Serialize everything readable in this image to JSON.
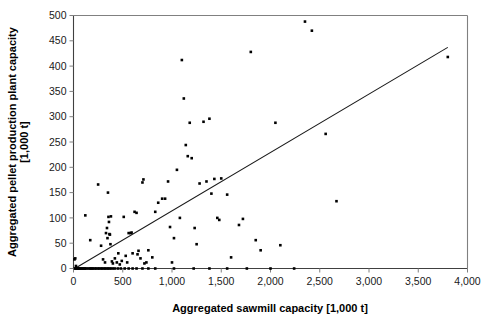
{
  "chart_data": {
    "type": "scatter",
    "title": "",
    "xlabel": "Aggregated sawmill capacity [1,000 t]",
    "ylabel": "Aggregated pellet production plant capacity [1,000 t]",
    "ylabel_line1": "Aggregated pellet production plant capacity",
    "ylabel_line2": "[1,000 t]",
    "xlim": [
      0,
      4000
    ],
    "ylim": [
      0,
      500
    ],
    "xticks": [
      0,
      500,
      1000,
      1500,
      2000,
      2500,
      3000,
      3500,
      4000
    ],
    "xtick_labels": [
      "0",
      "500",
      "1,000",
      "1,500",
      "2,000",
      "2,500",
      "3,000",
      "3,500",
      "4,000"
    ],
    "yticks": [
      0,
      50,
      100,
      150,
      200,
      250,
      300,
      350,
      400,
      450,
      500
    ],
    "ytick_labels": [
      "0",
      "50",
      "100",
      "150",
      "200",
      "250",
      "300",
      "350",
      "400",
      "450",
      "500"
    ],
    "grid": false,
    "legend": null,
    "marker": "square",
    "marker_color": "#000000",
    "trendline": {
      "type": "linear",
      "x": [
        30,
        3800
      ],
      "y": [
        2,
        437
      ],
      "color": "#1a1a1a"
    },
    "points": [
      [
        15,
        0
      ],
      [
        20,
        0
      ],
      [
        25,
        5
      ],
      [
        10,
        18
      ],
      [
        18,
        20
      ],
      [
        30,
        0
      ],
      [
        40,
        0
      ],
      [
        45,
        0
      ],
      [
        55,
        0
      ],
      [
        60,
        0
      ],
      [
        70,
        0
      ],
      [
        80,
        0
      ],
      [
        90,
        0
      ],
      [
        100,
        0
      ],
      [
        110,
        0
      ],
      [
        120,
        0
      ],
      [
        130,
        0
      ],
      [
        150,
        0
      ],
      [
        165,
        0
      ],
      [
        175,
        0
      ],
      [
        190,
        0
      ],
      [
        200,
        0
      ],
      [
        215,
        0
      ],
      [
        230,
        0
      ],
      [
        245,
        0
      ],
      [
        260,
        0
      ],
      [
        275,
        0
      ],
      [
        290,
        0
      ],
      [
        305,
        0
      ],
      [
        320,
        0
      ],
      [
        335,
        0
      ],
      [
        350,
        0
      ],
      [
        365,
        0
      ],
      [
        380,
        0
      ],
      [
        400,
        0
      ],
      [
        420,
        0
      ],
      [
        450,
        0
      ],
      [
        480,
        0
      ],
      [
        520,
        0
      ],
      [
        560,
        0
      ],
      [
        600,
        0
      ],
      [
        640,
        0
      ],
      [
        700,
        0
      ],
      [
        760,
        0
      ],
      [
        830,
        0
      ],
      [
        1020,
        0
      ],
      [
        1220,
        0
      ],
      [
        1380,
        0
      ],
      [
        1560,
        0
      ],
      [
        1760,
        0
      ],
      [
        2000,
        0
      ],
      [
        2240,
        0
      ],
      [
        120,
        105
      ],
      [
        170,
        56
      ],
      [
        250,
        166
      ],
      [
        280,
        45
      ],
      [
        300,
        18
      ],
      [
        320,
        12
      ],
      [
        330,
        70
      ],
      [
        340,
        80
      ],
      [
        345,
        60
      ],
      [
        350,
        150
      ],
      [
        355,
        102
      ],
      [
        360,
        92
      ],
      [
        365,
        68
      ],
      [
        370,
        67
      ],
      [
        375,
        48
      ],
      [
        380,
        103
      ],
      [
        390,
        14
      ],
      [
        400,
        10
      ],
      [
        420,
        20
      ],
      [
        440,
        12
      ],
      [
        455,
        30
      ],
      [
        470,
        8
      ],
      [
        490,
        15
      ],
      [
        510,
        102
      ],
      [
        530,
        25
      ],
      [
        545,
        12
      ],
      [
        560,
        70
      ],
      [
        580,
        70
      ],
      [
        590,
        71
      ],
      [
        600,
        30
      ],
      [
        620,
        112
      ],
      [
        640,
        110
      ],
      [
        650,
        28
      ],
      [
        660,
        35
      ],
      [
        680,
        20
      ],
      [
        700,
        170
      ],
      [
        710,
        176
      ],
      [
        720,
        10
      ],
      [
        740,
        12
      ],
      [
        760,
        36
      ],
      [
        800,
        22
      ],
      [
        830,
        112
      ],
      [
        860,
        130
      ],
      [
        900,
        138
      ],
      [
        930,
        138
      ],
      [
        960,
        172
      ],
      [
        980,
        82
      ],
      [
        1000,
        12
      ],
      [
        1020,
        60
      ],
      [
        1050,
        195
      ],
      [
        1080,
        100
      ],
      [
        1100,
        412
      ],
      [
        1120,
        336
      ],
      [
        1140,
        244
      ],
      [
        1160,
        222
      ],
      [
        1180,
        288
      ],
      [
        1200,
        218
      ],
      [
        1230,
        80
      ],
      [
        1250,
        48
      ],
      [
        1280,
        168
      ],
      [
        1320,
        290
      ],
      [
        1350,
        172
      ],
      [
        1380,
        296
      ],
      [
        1400,
        148
      ],
      [
        1430,
        177
      ],
      [
        1460,
        100
      ],
      [
        1480,
        96
      ],
      [
        1500,
        178
      ],
      [
        1560,
        146
      ],
      [
        1600,
        22
      ],
      [
        1680,
        86
      ],
      [
        1720,
        98
      ],
      [
        1800,
        428
      ],
      [
        1850,
        56
      ],
      [
        1900,
        36
      ],
      [
        2050,
        288
      ],
      [
        2100,
        46
      ],
      [
        2350,
        488
      ],
      [
        2420,
        470
      ],
      [
        2560,
        266
      ],
      [
        2670,
        133
      ],
      [
        3800,
        418
      ]
    ]
  }
}
